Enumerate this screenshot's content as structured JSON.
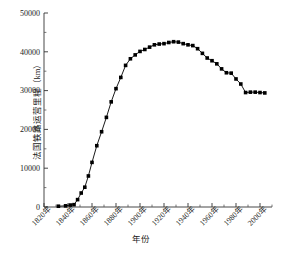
{
  "chart_data": {
    "type": "line",
    "title": "",
    "xlabel": "年份",
    "ylabel": "法国铁路运营里程（km）",
    "xlim": [
      1820,
      2010
    ],
    "ylim": [
      0,
      50000
    ],
    "grid": false,
    "legend": null,
    "marker": "filled-square",
    "line_color": "#000000",
    "marker_color": "#000000",
    "xticks": [
      1820,
      1840,
      1860,
      1880,
      1900,
      1920,
      1940,
      1960,
      1980,
      2000
    ],
    "xticklabels": [
      "1820年",
      "1840年",
      "1860年",
      "1880年",
      "1900年",
      "1920年",
      "1940年",
      "1960年",
      "1980年",
      "2000年"
    ],
    "xtick_rotation": -45,
    "x_minor_ticks_between": 1,
    "yticks": [
      0,
      10000,
      20000,
      30000,
      40000,
      50000
    ],
    "yticklabels": [
      "0",
      "10000",
      "20000",
      "30000",
      "40000",
      "50000"
    ],
    "y_minor_ticks_between": 1,
    "series": [
      {
        "name": "法国铁路运营里程",
        "x": [
          1832,
          1838,
          1842,
          1845,
          1848,
          1851,
          1854,
          1857,
          1860,
          1864,
          1868,
          1872,
          1876,
          1880,
          1884,
          1888,
          1892,
          1896,
          1900,
          1904,
          1908,
          1912,
          1916,
          1920,
          1924,
          1928,
          1932,
          1936,
          1940,
          1944,
          1948,
          1952,
          1956,
          1960,
          1964,
          1968,
          1972,
          1976,
          1980,
          1984,
          1988,
          1992,
          1996,
          2000,
          2004
        ],
        "y": [
          200,
          300,
          500,
          600,
          1900,
          3600,
          5100,
          8000,
          11500,
          15800,
          19400,
          23100,
          27100,
          30500,
          33400,
          36500,
          38200,
          39200,
          40100,
          40600,
          41200,
          41800,
          42000,
          42100,
          42400,
          42600,
          42500,
          42100,
          41800,
          41600,
          40800,
          39600,
          38400,
          37700,
          36900,
          35600,
          34600,
          34500,
          33000,
          31700,
          29500,
          29600,
          29600,
          29500,
          29400
        ]
      }
    ]
  },
  "figure": {
    "ylabel_text": "法国铁路运营里程（km）",
    "xlabel_text": "年份",
    "caption_text": ""
  }
}
